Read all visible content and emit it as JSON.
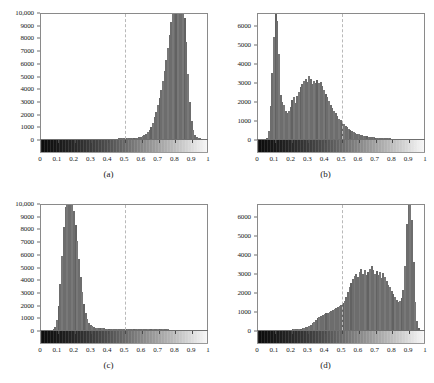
{
  "figure": {
    "background": "#ffffff",
    "bar_color": "#6d6d6d",
    "axis_color": "#8a8a8a",
    "dashed_line_color": "#b9b9b9",
    "layout": "2x2 grid of histograms with grayscale colorbar strips"
  },
  "chart_data": [
    {
      "type": "bar",
      "panel": "a",
      "title": "(a)",
      "xlabel": "",
      "ylabel": "",
      "xlim": [
        0,
        1
      ],
      "ylim": [
        0,
        10000
      ],
      "grid": false,
      "legend": null,
      "xticks": [
        "0",
        "0.1",
        "0.2",
        "0.3",
        "0.4",
        "0.5",
        "0.6",
        "0.7",
        "0.8",
        "0.9",
        "1"
      ],
      "yticks": [
        "0",
        "1000",
        "2000",
        "3000",
        "4000",
        "5000",
        "6000",
        "7000",
        "8000",
        "9000",
        "10,000"
      ],
      "annotations": [
        {
          "type": "vline",
          "x": 0.5,
          "style": "dashed"
        }
      ],
      "note": "clipped peak above 10,000 near x=0.84",
      "x": [
        0.005,
        0.015,
        0.025,
        0.035,
        0.045,
        0.055,
        0.065,
        0.075,
        0.085,
        0.095,
        0.105,
        0.115,
        0.125,
        0.135,
        0.145,
        0.155,
        0.165,
        0.175,
        0.185,
        0.195,
        0.205,
        0.215,
        0.225,
        0.235,
        0.245,
        0.255,
        0.265,
        0.275,
        0.285,
        0.295,
        0.305,
        0.315,
        0.325,
        0.335,
        0.345,
        0.355,
        0.365,
        0.375,
        0.385,
        0.395,
        0.405,
        0.415,
        0.425,
        0.435,
        0.445,
        0.455,
        0.465,
        0.475,
        0.485,
        0.495,
        0.505,
        0.515,
        0.525,
        0.535,
        0.545,
        0.555,
        0.565,
        0.575,
        0.585,
        0.595,
        0.605,
        0.615,
        0.625,
        0.635,
        0.645,
        0.655,
        0.665,
        0.675,
        0.685,
        0.695,
        0.705,
        0.715,
        0.725,
        0.735,
        0.745,
        0.755,
        0.765,
        0.775,
        0.785,
        0.795,
        0.805,
        0.815,
        0.825,
        0.835,
        0.845,
        0.855,
        0.865,
        0.875,
        0.885,
        0.895,
        0.905,
        0.915,
        0.925,
        0.935,
        0.945,
        0.955,
        0.965,
        0.975,
        0.985,
        0.995
      ],
      "values": [
        8,
        8,
        8,
        8,
        8,
        8,
        9,
        9,
        9,
        9,
        10,
        10,
        10,
        10,
        11,
        11,
        11,
        12,
        12,
        12,
        13,
        13,
        14,
        14,
        15,
        15,
        16,
        16,
        17,
        18,
        18,
        19,
        20,
        21,
        22,
        23,
        24,
        25,
        26,
        28,
        29,
        31,
        33,
        35,
        37,
        40,
        42,
        45,
        48,
        52,
        56,
        60,
        66,
        72,
        80,
        90,
        102,
        118,
        140,
        170,
        215,
        280,
        380,
        520,
        720,
        980,
        1300,
        1700,
        2150,
        2650,
        3200,
        3850,
        4550,
        5350,
        6250,
        7200,
        8200,
        9200,
        10000,
        10450,
        10600,
        10700,
        10700,
        10650,
        10400,
        9500,
        7600,
        5100,
        2900,
        1450,
        700,
        330,
        160,
        80,
        42,
        24,
        15,
        10,
        8,
        6
      ]
    },
    {
      "type": "bar",
      "panel": "b",
      "title": "(b)",
      "xlabel": "",
      "ylabel": "",
      "xlim": [
        0,
        1
      ],
      "ylim": [
        0,
        6700
      ],
      "grid": false,
      "legend": null,
      "xticks": [
        "0",
        "0.1",
        "0.2",
        "0.3",
        "0.4",
        "0.5",
        "0.6",
        "0.7",
        "0.8",
        "0.9",
        "1"
      ],
      "yticks": [
        "0",
        "1000",
        "2000",
        "3000",
        "4000",
        "5000",
        "6000"
      ],
      "annotations": [
        {
          "type": "vline",
          "x": 0.5,
          "style": "dashed"
        }
      ],
      "note": "sharp peak near x=0.10 clipped above 6700, broad hump 0.25-0.42",
      "x": [
        0.005,
        0.015,
        0.025,
        0.035,
        0.045,
        0.055,
        0.065,
        0.075,
        0.085,
        0.095,
        0.105,
        0.115,
        0.125,
        0.135,
        0.145,
        0.155,
        0.165,
        0.175,
        0.185,
        0.195,
        0.205,
        0.215,
        0.225,
        0.235,
        0.245,
        0.255,
        0.265,
        0.275,
        0.285,
        0.295,
        0.305,
        0.315,
        0.325,
        0.335,
        0.345,
        0.355,
        0.365,
        0.375,
        0.385,
        0.395,
        0.405,
        0.415,
        0.425,
        0.435,
        0.445,
        0.455,
        0.465,
        0.475,
        0.485,
        0.495,
        0.505,
        0.515,
        0.525,
        0.535,
        0.545,
        0.555,
        0.565,
        0.575,
        0.585,
        0.595,
        0.605,
        0.615,
        0.625,
        0.635,
        0.645,
        0.655,
        0.665,
        0.675,
        0.685,
        0.695,
        0.705,
        0.715,
        0.725,
        0.735,
        0.745,
        0.755,
        0.765,
        0.775,
        0.785,
        0.795,
        0.805,
        0.815,
        0.825,
        0.835,
        0.845,
        0.855,
        0.865,
        0.875,
        0.885,
        0.895,
        0.905,
        0.915,
        0.925,
        0.935,
        0.945,
        0.955,
        0.965,
        0.975,
        0.985,
        0.995
      ],
      "values": [
        5,
        5,
        6,
        6,
        8,
        40,
        420,
        1750,
        3500,
        5400,
        6700,
        6200,
        4500,
        2300,
        1950,
        1800,
        1500,
        1350,
        1500,
        1700,
        2050,
        2200,
        1900,
        2250,
        2500,
        2750,
        2900,
        3050,
        3150,
        3000,
        3350,
        3150,
        2900,
        3050,
        2950,
        3100,
        2950,
        3000,
        2800,
        2600,
        2400,
        2200,
        2000,
        1800,
        1650,
        1500,
        1350,
        1200,
        1080,
        980,
        880,
        780,
        690,
        610,
        540,
        470,
        420,
        370,
        330,
        290,
        255,
        225,
        200,
        175,
        155,
        140,
        125,
        110,
        98,
        88,
        78,
        70,
        62,
        56,
        50,
        45,
        40,
        36,
        32,
        29,
        26,
        23,
        21,
        19,
        17,
        15,
        14,
        12,
        11,
        10,
        9,
        8,
        8,
        7,
        7,
        6,
        6,
        5,
        5,
        5,
        5
      ]
    },
    {
      "type": "bar",
      "panel": "c",
      "title": "(c)",
      "xlabel": "",
      "ylabel": "",
      "xlim": [
        0,
        1
      ],
      "ylim": [
        0,
        10000
      ],
      "grid": false,
      "legend": null,
      "xticks": [
        "0",
        "0.1",
        "0.2",
        "0.3",
        "0.4",
        "0.5",
        "0.6",
        "0.7",
        "0.8",
        "0.9",
        "1"
      ],
      "yticks": [
        "0",
        "1000",
        "2000",
        "3000",
        "4000",
        "5000",
        "6000",
        "7000",
        "8000",
        "9000",
        "10,000"
      ],
      "annotations": [
        {
          "type": "vline",
          "x": 0.5,
          "style": "dashed"
        }
      ],
      "note": "clipped peak above 10,000 near x=0.16",
      "x": [
        0.005,
        0.015,
        0.025,
        0.035,
        0.045,
        0.055,
        0.065,
        0.075,
        0.085,
        0.095,
        0.105,
        0.115,
        0.125,
        0.135,
        0.145,
        0.155,
        0.165,
        0.175,
        0.185,
        0.195,
        0.205,
        0.215,
        0.225,
        0.235,
        0.245,
        0.255,
        0.265,
        0.275,
        0.285,
        0.295,
        0.305,
        0.315,
        0.325,
        0.335,
        0.345,
        0.355,
        0.365,
        0.375,
        0.385,
        0.395,
        0.405,
        0.415,
        0.425,
        0.435,
        0.445,
        0.455,
        0.465,
        0.475,
        0.485,
        0.495,
        0.505,
        0.515,
        0.525,
        0.535,
        0.545,
        0.555,
        0.565,
        0.575,
        0.585,
        0.595,
        0.605,
        0.615,
        0.625,
        0.635,
        0.645,
        0.655,
        0.665,
        0.675,
        0.685,
        0.695,
        0.705,
        0.715,
        0.725,
        0.735,
        0.745,
        0.755,
        0.765,
        0.775,
        0.785,
        0.795,
        0.805,
        0.815,
        0.825,
        0.835,
        0.845,
        0.855,
        0.865,
        0.875,
        0.885,
        0.895,
        0.905,
        0.915,
        0.925,
        0.935,
        0.945,
        0.955,
        0.965,
        0.975,
        0.985,
        0.995
      ],
      "values": [
        10,
        10,
        11,
        11,
        12,
        14,
        20,
        60,
        260,
        800,
        1900,
        3600,
        5800,
        8100,
        9700,
        10500,
        10700,
        10600,
        10200,
        9400,
        8300,
        7000,
        5600,
        4200,
        3000,
        2050,
        1350,
        880,
        580,
        400,
        290,
        225,
        185,
        160,
        145,
        135,
        128,
        122,
        118,
        115,
        112,
        110,
        108,
        106,
        104,
        102,
        100,
        98,
        96,
        94,
        92,
        90,
        88,
        86,
        84,
        82,
        80,
        78,
        76,
        74,
        72,
        70,
        68,
        66,
        64,
        62,
        60,
        58,
        56,
        54,
        52,
        50,
        48,
        46,
        44,
        42,
        40,
        38,
        36,
        34,
        32,
        30,
        28,
        26,
        24,
        22,
        20,
        18,
        16,
        14,
        12,
        11,
        10,
        9,
        8,
        8,
        7,
        7,
        6,
        6
      ]
    },
    {
      "type": "bar",
      "panel": "d",
      "title": "(d)",
      "xlabel": "",
      "ylabel": "",
      "xlim": [
        0,
        1
      ],
      "ylim": [
        0,
        6700
      ],
      "grid": false,
      "legend": null,
      "xticks": [
        "0",
        "0.1",
        "0.2",
        "0.3",
        "0.4",
        "0.5",
        "0.6",
        "0.7",
        "0.8",
        "0.9",
        "1"
      ],
      "yticks": [
        "0",
        "1000",
        "2000",
        "3000",
        "4000",
        "5000",
        "6000"
      ],
      "annotations": [
        {
          "type": "vline",
          "x": 0.5,
          "style": "dashed"
        }
      ],
      "note": "broad hump 0.6-0.8 with tall clipped spike near x=0.90",
      "x": [
        0.005,
        0.015,
        0.025,
        0.035,
        0.045,
        0.055,
        0.065,
        0.075,
        0.085,
        0.095,
        0.105,
        0.115,
        0.125,
        0.135,
        0.145,
        0.155,
        0.165,
        0.175,
        0.185,
        0.195,
        0.205,
        0.215,
        0.225,
        0.235,
        0.245,
        0.255,
        0.265,
        0.275,
        0.285,
        0.295,
        0.305,
        0.315,
        0.325,
        0.335,
        0.345,
        0.355,
        0.365,
        0.375,
        0.385,
        0.395,
        0.405,
        0.415,
        0.425,
        0.435,
        0.445,
        0.455,
        0.465,
        0.475,
        0.485,
        0.495,
        0.505,
        0.515,
        0.525,
        0.535,
        0.545,
        0.555,
        0.565,
        0.575,
        0.585,
        0.595,
        0.605,
        0.615,
        0.625,
        0.635,
        0.645,
        0.655,
        0.665,
        0.675,
        0.685,
        0.695,
        0.705,
        0.715,
        0.725,
        0.735,
        0.745,
        0.755,
        0.765,
        0.775,
        0.785,
        0.795,
        0.805,
        0.815,
        0.825,
        0.835,
        0.845,
        0.855,
        0.865,
        0.875,
        0.885,
        0.895,
        0.905,
        0.915,
        0.925,
        0.935,
        0.945,
        0.955,
        0.965,
        0.975,
        0.985,
        0.995
      ],
      "values": [
        3,
        3,
        3,
        4,
        4,
        4,
        5,
        5,
        6,
        6,
        7,
        8,
        9,
        10,
        12,
        14,
        16,
        19,
        22,
        26,
        31,
        37,
        44,
        53,
        64,
        78,
        95,
        118,
        148,
        185,
        230,
        290,
        360,
        440,
        530,
        620,
        700,
        760,
        800,
        840,
        880,
        920,
        960,
        1010,
        1060,
        1110,
        1150,
        1200,
        1250,
        1300,
        1400,
        1550,
        1750,
        1980,
        2250,
        2480,
        2700,
        2850,
        2950,
        2800,
        3050,
        3200,
        2950,
        3150,
        2900,
        3050,
        3200,
        3380,
        3150,
        2950,
        3100,
        2900,
        3050,
        2750,
        3000,
        2800,
        2600,
        2400,
        2250,
        2050,
        1900,
        1750,
        1600,
        1500,
        1550,
        1700,
        2100,
        3400,
        5600,
        6700,
        6600,
        5800,
        3600,
        1500,
        450,
        90,
        20,
        8,
        5,
        4
      ]
    }
  ],
  "panels": {
    "a": {
      "caption": "(a)",
      "zero_label": "0"
    },
    "b": {
      "caption": "(b)",
      "zero_label": "0"
    },
    "c": {
      "caption": "(c)",
      "zero_label": "0"
    },
    "d": {
      "caption": "(d)",
      "zero_label": "0"
    }
  }
}
